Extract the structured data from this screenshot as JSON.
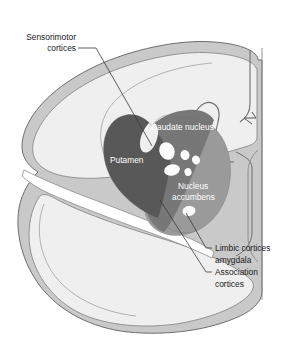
{
  "figure": {
    "background_color": "#ffffff"
  },
  "palette": {
    "background": "#ffffff",
    "cortical_ribbon": "#c9c9c9",
    "white_matter": "#efefef",
    "white_matter_alt": "#e9e9e9",
    "putamen": "#585858",
    "caudate": "#777777",
    "accumbens": "#9a9a9a",
    "fascicle": "#fbfbfb",
    "outline": "#6e6e6e",
    "thin_outline": "#8a8a8a",
    "leader_line": "#3a3a3a",
    "label_dark": "#1a1a1a",
    "label_light": "#ffffff"
  },
  "labels": {
    "sensorimotor": {
      "line1": "Sensorimotor",
      "line2": "cortices"
    },
    "caudate_nucleus": "Caudate nucleus",
    "putamen": "Putamen",
    "nucleus_accumbens": {
      "line1": "Nucleus",
      "line2": "accumbens"
    },
    "limbic": {
      "line1": "Limbic cortices",
      "line2": "amygdala"
    },
    "association": {
      "line1": "Association",
      "line2": "cortices"
    }
  },
  "structures": [
    {
      "name": "putamen",
      "label": "Putamen",
      "shade": "#585858"
    },
    {
      "name": "caudate-nucleus",
      "label": "Caudate nucleus",
      "shade": "#777777"
    },
    {
      "name": "nucleus-accumbens",
      "label": "Nucleus accumbens",
      "shade": "#9a9a9a"
    },
    {
      "name": "internal-capsule-fascicles",
      "label": "",
      "shade": "#fbfbfb"
    },
    {
      "name": "cerebral-cortex-ribbon",
      "label": "",
      "shade": "#c9c9c9"
    },
    {
      "name": "cerebral-white-matter",
      "label": "",
      "shade": "#efefef"
    }
  ]
}
